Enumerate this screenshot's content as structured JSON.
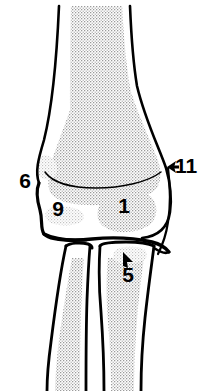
{
  "figure": {
    "type": "medical-illustration",
    "view": "anteroposterior",
    "background_color": "#ffffff",
    "line_color": "#000000",
    "stipple_color": "#9a9a9a",
    "width": 200,
    "height": 391
  },
  "labels": [
    {
      "id": "label-6",
      "text": "6",
      "x": 25,
      "y": 182,
      "has_arrow": false
    },
    {
      "id": "label-11",
      "text": "11",
      "x": 184,
      "y": 167,
      "has_arrow": true,
      "arrow": "left"
    },
    {
      "id": "label-9",
      "text": "9",
      "x": 58,
      "y": 210,
      "has_arrow": false
    },
    {
      "id": "label-1",
      "text": "1",
      "x": 124,
      "y": 207,
      "has_arrow": false
    },
    {
      "id": "label-5",
      "text": "5",
      "x": 128,
      "y": 276,
      "has_arrow": true,
      "arrow": "up-left"
    }
  ],
  "structures": [
    {
      "id": "proximal-shaft",
      "name": "proximal bone shaft"
    },
    {
      "id": "distal-epiphysis",
      "name": "distal epiphysis with condyles"
    },
    {
      "id": "medial-epicondyle",
      "name": "medial epicondyle",
      "label": "6"
    },
    {
      "id": "lateral-margin",
      "name": "lateral cortical margin",
      "label": "11"
    },
    {
      "id": "condyle-medial",
      "name": "medial condyle region",
      "label": "9"
    },
    {
      "id": "condyle-lateral",
      "name": "lateral condyle region",
      "label": "1"
    },
    {
      "id": "distal-bone-lateral",
      "name": "distal bone lateral",
      "label": "5"
    },
    {
      "id": "distal-bone-medial",
      "name": "distal bone medial"
    },
    {
      "id": "joint-space",
      "name": "joint space"
    }
  ]
}
